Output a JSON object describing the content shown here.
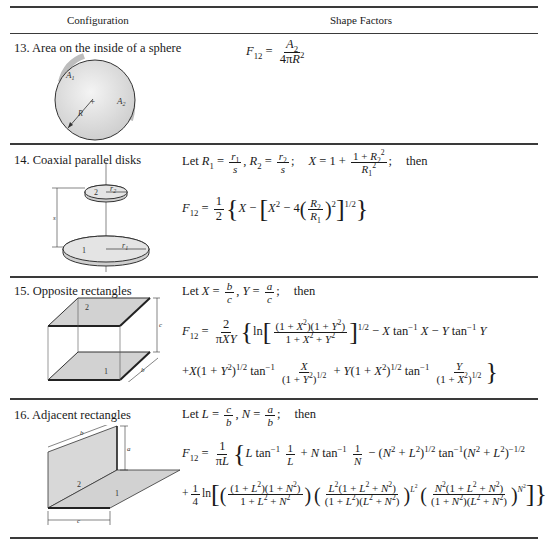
{
  "header": {
    "configuration": "Configuration",
    "shape_factors": "Shape Factors"
  },
  "rows": [
    {
      "label": "13. Area on the inside of a sphere",
      "diagram": {
        "labels": [
          "A1",
          "A2",
          "R"
        ]
      },
      "formula": {
        "lhs": "F12 =",
        "num": "A2",
        "den": "4πR2"
      }
    },
    {
      "label": "14. Coaxial parallel disks",
      "diagram": {
        "labels": [
          "2",
          "r2",
          "s",
          "1",
          "r1"
        ]
      },
      "formula": {
        "let": "Let",
        "then": "then",
        "line1": "Let R1 = r1/s, R2 = r2/s;  X = 1 + (1 + R2^2)/R1^2;  then",
        "line2": "F12 = 1/2 { X − [ X^2 − 4 (R2/R1)^2 ]^(1/2) }"
      }
    },
    {
      "label": "15. Opposite rectangles",
      "diagram": {
        "labels": [
          "2",
          "1",
          "c",
          "a",
          "b"
        ]
      },
      "formula": {
        "let": "Let",
        "then": "then",
        "line1": "Let X = b/c, Y = a/c;  then",
        "line2": "F12 = 2/(πXY) { ln [ (1+X^2)(1+Y^2) / (1+X^2+Y^2) ]^(1/2) − X tan^-1 X − Y tan^-1 Y",
        "line3": "+X(1+Y^2)^(1/2) tan^-1 X/(1+Y^2)^(1/2) + Y(1+X^2)^(1/2) tan^-1 Y/(1+X^2)^(1/2) }"
      }
    },
    {
      "label": "16. Adjacent rectangles",
      "diagram": {
        "labels": [
          "b",
          "a",
          "2",
          "1",
          "c"
        ]
      },
      "formula": {
        "let": "Let",
        "then": "then",
        "line1": "Let L = c/b, N = a/b;  then",
        "line2": "F12 = 1/(πL) { L tan^-1 1/L + N tan^-1 1/N − (N^2+L^2)^(1/2) tan^-1 (N^2+L^2)^(-1/2)",
        "line3": "+1/4 ln [ ( (1+L^2)(1+N^2) / (1+L^2+N^2) ) ( L^2(1+L^2+N^2) / ((1+L^2)(L^2+N^2)) )^(L^2) ( N^2(1+L^2+N^2) / ((1+N^2)(L^2+N^2)) )^(N^2) ] }"
      }
    }
  ]
}
